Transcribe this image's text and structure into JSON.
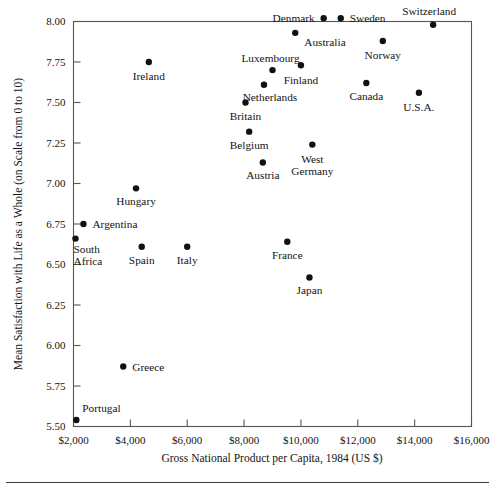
{
  "chart_data": {
    "type": "scatter",
    "title": "",
    "xlabel": "Gross National Product per Capita, 1984 (US $)",
    "ylabel": "Mean Satisfaction with Life as a Whole (on Scale from 0 to 10)",
    "xlim": [
      2000,
      16000
    ],
    "ylim": [
      5.5,
      8.0
    ],
    "grid": false,
    "legend": "none",
    "xticks": [
      2000,
      4000,
      6000,
      8000,
      10000,
      12000,
      14000,
      16000
    ],
    "xtick_labels": [
      "$2,000",
      "$4,000",
      "$6,000",
      "$8,000",
      "$10,000",
      "$12,000",
      "$14,000",
      "$16,000"
    ],
    "yticks": [
      5.5,
      5.75,
      6.0,
      6.25,
      6.5,
      6.75,
      7.0,
      7.25,
      7.5,
      7.75,
      8.0
    ],
    "ytick_labels": [
      "5.50",
      "5.75",
      "6.00",
      "6.25",
      "6.50",
      "6.75",
      "7.00",
      "7.25",
      "7.50",
      "7.75",
      "8.00"
    ],
    "points": [
      {
        "label": "Portugal",
        "x": 2100,
        "y": 5.54,
        "label_dx": 6,
        "label_dy": -8,
        "anchor": "start"
      },
      {
        "label": "South\nAfrica",
        "x": 2070,
        "y": 6.66,
        "label_dx": -2,
        "label_dy": 14,
        "anchor": "start"
      },
      {
        "label": "Argentina",
        "x": 2350,
        "y": 6.75,
        "label_dx": 9,
        "label_dy": 4,
        "anchor": "start"
      },
      {
        "label": "Greece",
        "x": 3750,
        "y": 5.87,
        "label_dx": 9,
        "label_dy": 4,
        "anchor": "start"
      },
      {
        "label": "Hungary",
        "x": 4200,
        "y": 6.97,
        "label_dx": 0,
        "label_dy": 17,
        "anchor": "middle"
      },
      {
        "label": "Spain",
        "x": 4400,
        "y": 6.61,
        "label_dx": 0,
        "label_dy": 17,
        "anchor": "middle"
      },
      {
        "label": "Ireland",
        "x": 4650,
        "y": 7.75,
        "label_dx": 0,
        "label_dy": 18,
        "anchor": "middle"
      },
      {
        "label": "Italy",
        "x": 6000,
        "y": 6.61,
        "label_dx": 0,
        "label_dy": 17,
        "anchor": "middle"
      },
      {
        "label": "Britain",
        "x": 8050,
        "y": 7.5,
        "label_dx": 0,
        "label_dy": 17,
        "anchor": "middle"
      },
      {
        "label": "Belgium",
        "x": 8180,
        "y": 7.32,
        "label_dx": 0,
        "label_dy": 17,
        "anchor": "middle"
      },
      {
        "label": "Netherlands",
        "x": 8700,
        "y": 7.61,
        "label_dx": 6,
        "label_dy": 16,
        "anchor": "middle"
      },
      {
        "label": "Austria",
        "x": 8660,
        "y": 7.13,
        "label_dx": 0,
        "label_dy": 17,
        "anchor": "middle"
      },
      {
        "label": "Luxembourg",
        "x": 9000,
        "y": 7.7,
        "label_dx": -2,
        "label_dy": -8,
        "anchor": "middle"
      },
      {
        "label": "France",
        "x": 9520,
        "y": 6.64,
        "label_dx": 0,
        "label_dy": 17,
        "anchor": "middle"
      },
      {
        "label": "Australia",
        "x": 9800,
        "y": 7.93,
        "label_dx": 9,
        "label_dy": 13,
        "anchor": "start"
      },
      {
        "label": "Finland",
        "x": 10000,
        "y": 7.73,
        "label_dx": 0,
        "label_dy": 19,
        "anchor": "middle"
      },
      {
        "label": "Japan",
        "x": 10300,
        "y": 6.42,
        "label_dx": 0,
        "label_dy": 17,
        "anchor": "middle"
      },
      {
        "label": "West\nGermany",
        "x": 10400,
        "y": 7.24,
        "label_dx": 0,
        "label_dy": 18,
        "anchor": "middle"
      },
      {
        "label": "Denmark",
        "x": 10800,
        "y": 8.02,
        "label_dx": -9,
        "label_dy": 4,
        "anchor": "end"
      },
      {
        "label": "Sweden",
        "x": 11400,
        "y": 8.02,
        "label_dx": 9,
        "label_dy": 4,
        "anchor": "start"
      },
      {
        "label": "Canada",
        "x": 12300,
        "y": 7.62,
        "label_dx": 0,
        "label_dy": 17,
        "anchor": "middle"
      },
      {
        "label": "Norway",
        "x": 12880,
        "y": 7.88,
        "label_dx": 0,
        "label_dy": 18,
        "anchor": "middle"
      },
      {
        "label": "U.S.A.",
        "x": 14150,
        "y": 7.56,
        "label_dx": 0,
        "label_dy": 18,
        "anchor": "middle"
      },
      {
        "label": "Switzerland",
        "x": 14650,
        "y": 7.98,
        "label_dx": -4,
        "label_dy": -10,
        "anchor": "middle"
      }
    ]
  },
  "colors": {
    "background": "#ffffff",
    "point": "#111111",
    "axis": "#555555",
    "text": "#141414",
    "rule": "#3a3a3a"
  }
}
